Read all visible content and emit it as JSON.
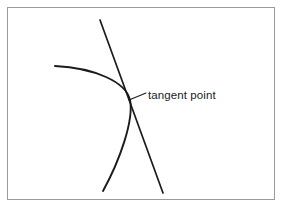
{
  "figure": {
    "title": "",
    "background_color": "#ffffff",
    "ink_color": "#1b1b1b",
    "frame": {
      "name": "figure-border",
      "color": "#9a9a9a",
      "x": 7,
      "y": 7,
      "width": 268,
      "height": 193
    },
    "annotations": [
      {
        "id": "tangent-point",
        "label": "tangent point",
        "leader_from_x": 129,
        "leader_from_y": 100,
        "leader_to_x": 146,
        "leader_to_y": 93,
        "text_x": 148,
        "text_y": 89,
        "font_size_px": 11.5
      }
    ],
    "shapes": [
      {
        "id": "curve",
        "name": "tangent-curve",
        "type": "curve",
        "description": "smooth curve opening to the left, tangent to the straight line",
        "path": "M 55 66 C 95 68 126 82 130 100 C 134 120 120 160 103 191",
        "stroke_width": 1.9
      },
      {
        "id": "line",
        "name": "tangent-line",
        "type": "line",
        "description": "straight line touching the curve at the tangent point",
        "x1": 100,
        "y1": 20,
        "x2": 163,
        "y2": 193,
        "stroke_width": 1.7
      }
    ]
  }
}
